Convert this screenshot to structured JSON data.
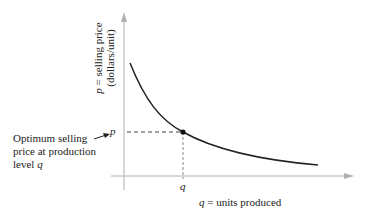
{
  "diagram": {
    "y_axis_label_line1_var": "p",
    "y_axis_label_line1_rest": " = selling price",
    "y_axis_label_line2": "(dollars/unit)",
    "x_axis_label_var": "q",
    "x_axis_label_rest": " = units produced",
    "p_tick": "p",
    "q_tick": "q",
    "annotation_line1": "Optimum selling",
    "annotation_line2": "price at production",
    "annotation_line3_text": "level ",
    "annotation_line3_var": "q",
    "colors": {
      "curve": "#222222",
      "axis": "#aaaaaa",
      "dash": "#444444"
    }
  }
}
